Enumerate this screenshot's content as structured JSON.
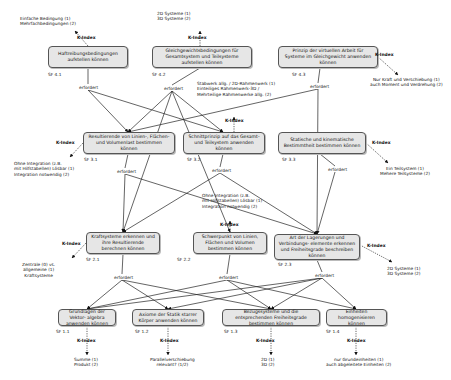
{
  "diagram": {
    "kindex_label": "K-Index",
    "requires_label": "erfordert",
    "nodes": [
      {
        "id": "sf41",
        "sf": "SF 4.1",
        "text": "Haftreibungsbedingungen aufstellen können",
        "kindex": [
          "Einfache Bedingung (1)",
          "Mehrfachbedingungen (2)"
        ]
      },
      {
        "id": "sf42",
        "sf": "SF 4.2",
        "text": "Gleichgewichtsbedingungen für Gesamtsystem und Teilsysteme aufstellen können",
        "kindex": [
          "2D Systeme (1)",
          "3D Systeme (2)"
        ]
      },
      {
        "id": "sf43",
        "sf": "SF 4.3",
        "text": "Prinzip der virtuellen Arbeit für Systeme im Gleichgewicht anwenden können",
        "kindex": [
          "Nur Kraft und Verschiebung (1)",
          "auch Moment und Verdrehung (2)"
        ]
      },
      {
        "id": "sf31",
        "sf": "SF 3.1",
        "text": "Resultierende von Linien-, Flächen- und Volumenlast bestimmen können",
        "kindex": [
          "Ohne Integration (z.B.",
          "mit Hilfstabellen) Lösbar (1)",
          "Integration notwendig (2)"
        ]
      },
      {
        "id": "sf32",
        "sf": "SF 3.2",
        "text": "Schnittprinzip auf das Gesamt- und Teilsystem anwenden können",
        "kindex": [
          "Stabwerk allg. / 2D-Rahmenwerk (1)",
          "Einteiliges Rahmenwerk-3D /",
          "Mehrteilige Rahmenwerke allg. (2)"
        ]
      },
      {
        "id": "sf33",
        "sf": "SF 3.3",
        "text": "Statische und kinematische Bestimmtheit bestimmen können",
        "kindex": [
          "Ein Teilsystem (1)",
          "Mehere Teilsysteme (2)"
        ]
      },
      {
        "id": "sf21",
        "sf": "SF 2.1",
        "text": "Kraftsysteme erkennen und ihre Resultierende berechnen können",
        "kindex": [
          "Zentrale (0) vs.",
          "allgemeine (1)",
          "Kraftsysteme"
        ]
      },
      {
        "id": "sf22",
        "sf": "SF 2.2",
        "text": "Schwerpunkt von Linien, Flächen und Volumen bestimmen können",
        "kindex": [
          "Ohne Integration (z.B.",
          "mit Hilfstabellen) Lösbar (1)",
          "Integration notwendig (2)"
        ]
      },
      {
        "id": "sf23",
        "sf": "SF 2.3",
        "text": "Art der Lagerungen und Verbindungs- elemente erkennen und Freiheitsgrade beschreiben können",
        "kindex": [
          "2D Systeme (1)",
          "3D Systeme (2)"
        ]
      },
      {
        "id": "sf11",
        "sf": "SF 1.1",
        "text": "Grundlagen der Vektor- algebra anwenden können",
        "kindex": [
          "Summe (1)",
          "Produkt (2)"
        ]
      },
      {
        "id": "sf12",
        "sf": "SF 1.2",
        "text": "Axiome der Statik starrer Körper anwenden können",
        "kindex": [
          "Parallelverschiebung",
          "relevant? (1/2)"
        ]
      },
      {
        "id": "sf13",
        "sf": "SF 1.3",
        "text": "Bezugssysteme und die entsprechenden Freiheitsgrade bestimmen können",
        "kindex": [
          "2D (1)",
          "3D (2)"
        ]
      },
      {
        "id": "sf14",
        "sf": "SF 1.4",
        "text": "Einheiten homogenisieren können",
        "kindex": [
          "nur Grundeinheiten (1)",
          "auch abgeleitete Einheiten (2)"
        ]
      }
    ],
    "edges": [
      {
        "from": "sf41",
        "to": "sf31"
      },
      {
        "from": "sf41",
        "to": "sf32"
      },
      {
        "from": "sf42",
        "to": "sf31"
      },
      {
        "from": "sf42",
        "to": "sf32"
      },
      {
        "from": "sf42",
        "to": "sf21"
      },
      {
        "from": "sf42",
        "to": "sf22"
      },
      {
        "from": "sf43",
        "to": "sf31"
      },
      {
        "from": "sf43",
        "to": "sf23"
      },
      {
        "from": "sf31",
        "to": "sf21"
      },
      {
        "from": "sf31",
        "to": "sf23"
      },
      {
        "from": "sf32",
        "to": "sf21"
      },
      {
        "from": "sf32",
        "to": "sf23"
      },
      {
        "from": "sf33",
        "to": "sf23"
      },
      {
        "from": "sf21",
        "to": "sf11"
      },
      {
        "from": "sf21",
        "to": "sf12"
      },
      {
        "from": "sf21",
        "to": "sf13"
      },
      {
        "from": "sf22",
        "to": "sf11"
      },
      {
        "from": "sf22",
        "to": "sf13"
      },
      {
        "from": "sf22",
        "to": "sf14"
      },
      {
        "from": "sf23",
        "to": "sf11"
      },
      {
        "from": "sf23",
        "to": "sf12"
      },
      {
        "from": "sf23",
        "to": "sf13"
      },
      {
        "from": "sf23",
        "to": "sf14"
      }
    ]
  }
}
